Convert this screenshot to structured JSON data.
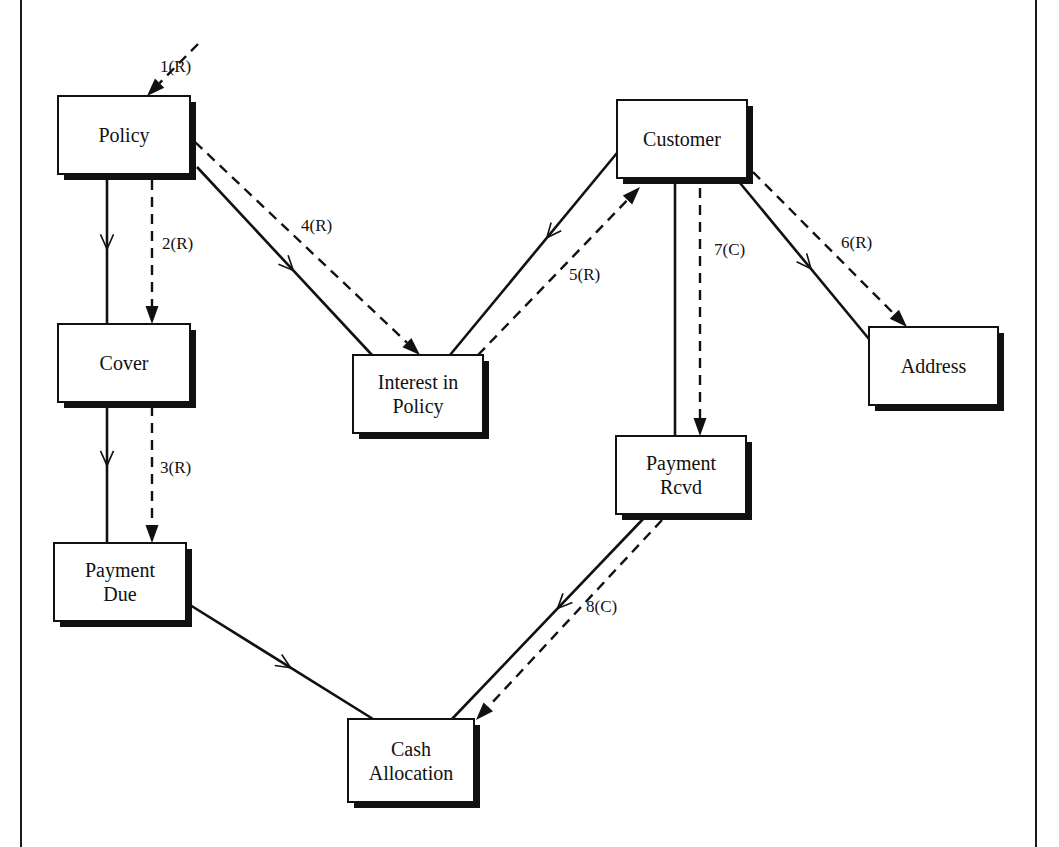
{
  "diagram": {
    "entities": [
      {
        "id": "policy",
        "lines": [
          "Policy"
        ]
      },
      {
        "id": "cover",
        "lines": [
          "Cover"
        ]
      },
      {
        "id": "payment-due",
        "lines": [
          "Payment",
          "Due"
        ]
      },
      {
        "id": "interest-in-policy",
        "lines": [
          "Interest in",
          "Policy"
        ]
      },
      {
        "id": "customer",
        "lines": [
          "Customer"
        ]
      },
      {
        "id": "address",
        "lines": [
          "Address"
        ]
      },
      {
        "id": "payment-rcvd",
        "lines": [
          "Payment",
          "Rcvd"
        ]
      },
      {
        "id": "cash-allocation",
        "lines": [
          "Cash",
          "Allocation"
        ]
      }
    ],
    "relationships": [
      {
        "from": "policy",
        "to": "cover"
      },
      {
        "from": "policy",
        "to": "interest-in-policy"
      },
      {
        "from": "cover",
        "to": "payment-due"
      },
      {
        "from": "customer",
        "to": "interest-in-policy"
      },
      {
        "from": "customer",
        "to": "address"
      },
      {
        "from": "customer",
        "to": "payment-rcvd"
      },
      {
        "from": "payment-due",
        "to": "cash-allocation"
      },
      {
        "from": "payment-rcvd",
        "to": "cash-allocation"
      }
    ],
    "access_paths": [
      {
        "label": "1(R)",
        "from": "entry",
        "to": "policy"
      },
      {
        "label": "2(R)",
        "from": "policy",
        "to": "cover"
      },
      {
        "label": "3(R)",
        "from": "cover",
        "to": "payment-due"
      },
      {
        "label": "4(R)",
        "from": "policy",
        "to": "interest-in-policy"
      },
      {
        "label": "5(R)",
        "from": "interest-in-policy",
        "to": "customer"
      },
      {
        "label": "6(R)",
        "from": "customer",
        "to": "address"
      },
      {
        "label": "7(C)",
        "from": "customer",
        "to": "payment-rcvd"
      },
      {
        "label": "8(C)",
        "from": "payment-rcvd",
        "to": "cash-allocation"
      }
    ]
  }
}
